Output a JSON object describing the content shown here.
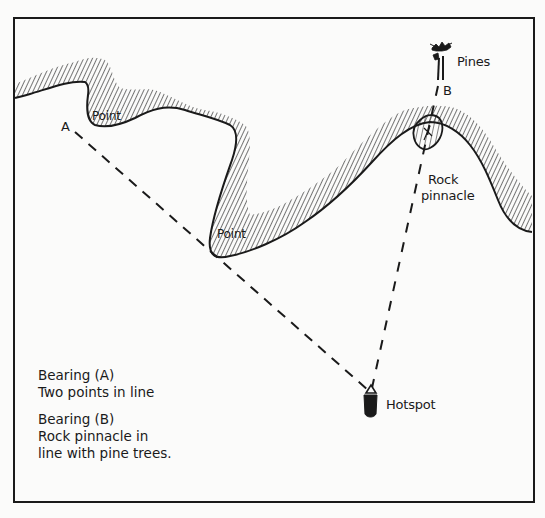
{
  "diagram": {
    "type": "nautical-bearing-sketch",
    "colors": {
      "ink": "#1a1a1a",
      "paper": "#fbfbfa"
    },
    "frame": {
      "x": 14,
      "y": 18,
      "width": 520,
      "height": 484
    },
    "labels": {
      "point_1": "Point",
      "point_2": "Point",
      "mark_a": "A",
      "mark_b": "B",
      "pines": "Pines",
      "rock": "Rock",
      "pinnacle": "pinnacle",
      "hotspot": "Hotspot"
    },
    "legend": {
      "bearing_a_title": "Bearing (A)",
      "bearing_a_desc": "Two points in line",
      "bearing_b_title": "Bearing (B)",
      "bearing_b_line1": "Rock pinnacle in",
      "bearing_b_line2": "line with pine trees."
    },
    "bearings": [
      {
        "id": "A",
        "from": [
          75,
          130
        ],
        "to": [
          370,
          392
        ],
        "style": "dashed"
      },
      {
        "id": "B",
        "from": [
          438,
          88
        ],
        "to": [
          372,
          388
        ],
        "style": "dashed"
      }
    ],
    "icons": [
      "pine-trees-icon",
      "rock-pinnacle-icon",
      "boat-icon"
    ]
  }
}
